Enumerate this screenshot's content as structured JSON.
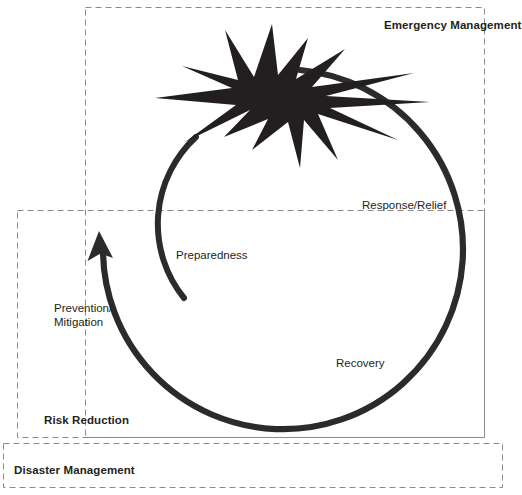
{
  "diagram": {
    "type": "cycle-diagram",
    "colors": {
      "ink": "#231f20",
      "arc": "#2b2b2b",
      "dashed_border": "#8a8a8a",
      "background": "#ffffff"
    }
  },
  "groups": [
    {
      "id": "emergency-management",
      "label": "Emergency Management"
    },
    {
      "id": "risk-reduction",
      "label": "Risk Reduction"
    },
    {
      "id": "disaster-management",
      "label": "Disaster Management"
    }
  ],
  "stages": [
    {
      "id": "preparedness",
      "label": "Preparedness"
    },
    {
      "id": "response-relief",
      "label": "Response/Relief"
    },
    {
      "id": "recovery",
      "label": "Recovery"
    },
    {
      "id": "prevention-mitigation",
      "line1": "Prevention/",
      "line2": "Mitigation"
    }
  ],
  "icons": {
    "disaster_burst": "explosion-burst-icon",
    "cycle_arrow": "cycle-arrow-icon"
  }
}
